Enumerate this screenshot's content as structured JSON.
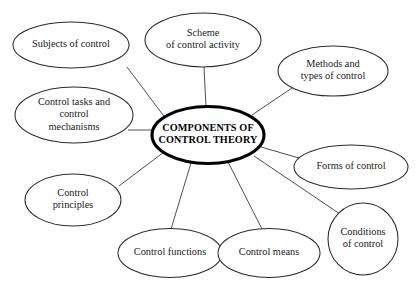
{
  "diagram": {
    "type": "mind-map",
    "background_color": "#ffffff",
    "node_stroke_color": "#2b2b2b",
    "center_stroke_color": "#000000",
    "connector_color": "#3a3a3a",
    "text_color": "#1a1a1a",
    "center": {
      "id": "center",
      "lines": [
        "COMPONENTS OF",
        "CONTROL THEORY"
      ],
      "line1": "COMPONENTS OF",
      "line2": "CONTROL THEORY",
      "cx": 208,
      "cy": 135,
      "rx": 56,
      "ry": 28.5
    },
    "nodes": [
      {
        "id": "subjects-of-control",
        "lines": [
          "Subjects of control"
        ],
        "line1": "Subjects of control",
        "cx": 71,
        "cy": 45,
        "rx": 58,
        "ry": 23
      },
      {
        "id": "scheme-of-control-activity",
        "lines": [
          "Scheme",
          "of control activity"
        ],
        "line1": "Scheme",
        "line2": "of control activity",
        "cx": 203,
        "cy": 40,
        "rx": 58,
        "ry": 27
      },
      {
        "id": "methods-and-types-of-control",
        "lines": [
          "Methods and",
          "types of control"
        ],
        "line1": "Methods and",
        "line2": "types of control",
        "cx": 333,
        "cy": 71,
        "rx": 55,
        "ry": 25
      },
      {
        "id": "control-tasks-and-control-mechanisms",
        "lines": [
          "Control tasks and",
          "control",
          "mechanisms"
        ],
        "line1": "Control tasks and",
        "line2": "control",
        "line3": "mechanisms",
        "cx": 74,
        "cy": 115,
        "rx": 59,
        "ry": 28
      },
      {
        "id": "forms-of-control",
        "lines": [
          "Forms of control"
        ],
        "line1": "Forms of control",
        "cx": 351,
        "cy": 167,
        "rx": 57,
        "ry": 22
      },
      {
        "id": "control-principles",
        "lines": [
          "Control",
          "principles"
        ],
        "line1": "Control",
        "line2": "principles",
        "cx": 73,
        "cy": 200,
        "rx": 48,
        "ry": 26
      },
      {
        "id": "conditions-of-control",
        "lines": [
          "Conditions",
          "of control"
        ],
        "line1": "Conditions",
        "line2": "of control",
        "cx": 363,
        "cy": 239,
        "rx": 35,
        "ry": 36
      },
      {
        "id": "control-functions",
        "lines": [
          "Control functions"
        ],
        "line1": "Control functions",
        "cx": 170,
        "cy": 253,
        "rx": 52,
        "ry": 24.5
      },
      {
        "id": "control-means",
        "lines": [
          "Control means"
        ],
        "line1": "Control means",
        "cx": 269,
        "cy": 253,
        "rx": 51,
        "ry": 24.5
      }
    ],
    "connectors": [
      {
        "id": "center-to-subjects-of-control",
        "x1": 166,
        "y1": 119,
        "x2": 127,
        "y2": 67
      },
      {
        "id": "center-to-scheme-of-control-activity",
        "x1": 206,
        "y1": 107,
        "x2": 204,
        "y2": 67
      },
      {
        "id": "center-to-methods-and-types-of-control",
        "x1": 252,
        "y1": 115,
        "x2": 292,
        "y2": 88
      },
      {
        "id": "center-to-control-tasks",
        "x1": 157,
        "y1": 130,
        "x2": 128,
        "y2": 130
      },
      {
        "id": "center-to-forms-of-control",
        "x1": 261,
        "y1": 147,
        "x2": 299,
        "y2": 158
      },
      {
        "id": "center-to-control-principles",
        "x1": 164,
        "y1": 152,
        "x2": 119,
        "y2": 186
      },
      {
        "id": "center-to-conditions-of-control",
        "x1": 254,
        "y1": 156,
        "x2": 340,
        "y2": 214
      },
      {
        "id": "center-to-control-functions",
        "x1": 191,
        "y1": 163,
        "x2": 171,
        "y2": 229
      },
      {
        "id": "center-to-control-means",
        "x1": 228,
        "y1": 162,
        "x2": 262,
        "y2": 229
      }
    ]
  }
}
